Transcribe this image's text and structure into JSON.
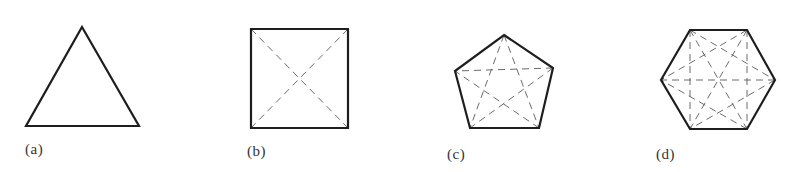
{
  "figure": {
    "panels": [
      {
        "label": "(a)",
        "shape": "triangle",
        "vertices": [
          [
            82,
            27
          ],
          [
            139,
            126
          ],
          [
            26,
            126
          ]
        ],
        "diagonals": false
      },
      {
        "label": "(b)",
        "shape": "square",
        "vertices": [
          [
            251,
            29
          ],
          [
            348,
            29
          ],
          [
            348,
            128
          ],
          [
            251,
            128
          ]
        ],
        "diagonals": true
      },
      {
        "label": "(c)",
        "shape": "pentagon",
        "vertices": [
          [
            504,
            35
          ],
          [
            553,
            68
          ],
          [
            539,
            128
          ],
          [
            470,
            128
          ],
          [
            455,
            71
          ]
        ],
        "diagonals": true
      },
      {
        "label": "(d)",
        "shape": "hexagon",
        "vertices": [
          [
            690,
            30
          ],
          [
            747,
            30
          ],
          [
            775,
            80
          ],
          [
            747,
            129
          ],
          [
            690,
            129
          ],
          [
            661,
            80
          ]
        ],
        "diagonals": true
      }
    ],
    "colors": {
      "edge": "#1e1e1e",
      "diagonal": "#5a5a5a",
      "label": "#333333"
    }
  }
}
